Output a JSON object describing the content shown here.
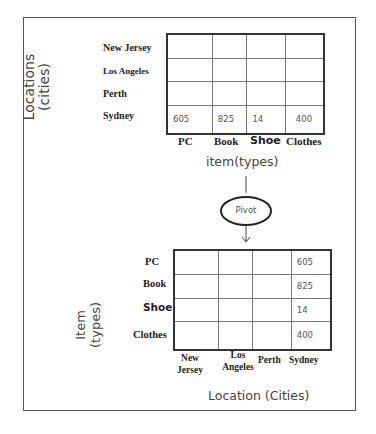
{
  "top_view": {
    "axis_label_vertical": [
      "Locations",
      "(cities)"
    ],
    "row_labels": [
      "New Jersey",
      "Los Angeles",
      "Perth",
      "Sydney"
    ],
    "column_labels": [
      "PC",
      "Book",
      "Shoe",
      "Clothes"
    ],
    "axis_label_horizontal": "item(types)",
    "cells": [
      [
        "",
        "",
        "",
        ""
      ],
      [
        "",
        "",
        "",
        ""
      ],
      [
        "",
        "",
        "",
        ""
      ],
      [
        "605",
        "825",
        "14",
        "400"
      ]
    ]
  },
  "pivot": {
    "label": "Pivot"
  },
  "bottom_view": {
    "axis_label_vertical": [
      "Item",
      "(types)"
    ],
    "row_labels": [
      "PC",
      "Book",
      "Shoe",
      "Clothes"
    ],
    "column_labels": [
      [
        "New",
        "Jersey"
      ],
      [
        "Los",
        "Angeles"
      ],
      [
        "Perth"
      ],
      [
        "Sydney"
      ]
    ],
    "axis_label_horizontal": "Location (Cities)",
    "cells": [
      [
        "",
        "",
        "",
        "605"
      ],
      [
        "",
        "",
        "",
        "825"
      ],
      [
        "",
        "",
        "",
        "14"
      ],
      [
        "",
        "",
        "",
        "400"
      ]
    ]
  }
}
